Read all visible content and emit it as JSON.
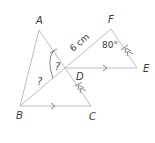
{
  "figure": {
    "points": {
      "A": "A",
      "B": "B",
      "C": "C",
      "D": "D",
      "E": "E",
      "F": "F"
    },
    "length_label": "6 cm",
    "angle_label_F": "80°",
    "unknown_angle_D": "?",
    "unknown_angle_B": "?",
    "segments": [
      "AB",
      "BC",
      "AC",
      "BF",
      "DE",
      "EF"
    ],
    "parallel_pairs": [
      [
        "BC",
        "DE"
      ],
      [
        "AC",
        "EF"
      ]
    ],
    "equal_tick_marks": [
      "AD",
      "DC",
      "EF"
    ],
    "colors": {
      "line": "#bdbdbd",
      "marks": "#7a7a7a",
      "text": "#3a3a3a"
    }
  }
}
